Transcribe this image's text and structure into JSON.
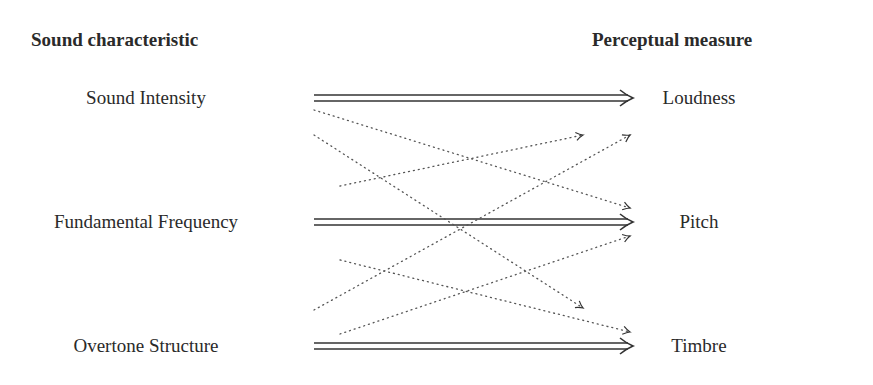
{
  "diagram": {
    "headers": {
      "left": "Sound characteristic",
      "right": "Perceptual measure"
    },
    "sound_characteristics": [
      {
        "label": "Sound Intensity",
        "y": 98
      },
      {
        "label": "Fundamental Frequency",
        "y": 222
      },
      {
        "label": "Overtone Structure",
        "y": 346
      }
    ],
    "perceptual_measures": [
      {
        "label": "Loudness",
        "y": 98
      },
      {
        "label": "Pitch",
        "y": 222
      },
      {
        "label": "Timbre",
        "y": 346
      }
    ],
    "primary_mappings": [
      {
        "from": "Sound Intensity",
        "to": "Loudness",
        "style": "double-arrow"
      },
      {
        "from": "Fundamental Frequency",
        "to": "Pitch",
        "style": "double-arrow"
      },
      {
        "from": "Overtone Structure",
        "to": "Timbre",
        "style": "double-arrow"
      }
    ],
    "secondary_mappings": [
      {
        "from": "Sound Intensity",
        "to": "Pitch",
        "style": "dotted-arrow"
      },
      {
        "from": "Sound Intensity",
        "to": "Timbre",
        "style": "dotted-arrow"
      },
      {
        "from": "Fundamental Frequency",
        "to": "Loudness",
        "style": "dotted-arrow"
      },
      {
        "from": "Fundamental Frequency",
        "to": "Timbre",
        "style": "dotted-arrow"
      },
      {
        "from": "Overtone Structure",
        "to": "Loudness",
        "style": "dotted-arrow"
      },
      {
        "from": "Overtone Structure",
        "to": "Pitch",
        "style": "dotted-arrow"
      }
    ],
    "colors": {
      "text": "#2a2a2a",
      "arrow": "#333333",
      "dotted": "#555555",
      "background": "#ffffff"
    }
  }
}
